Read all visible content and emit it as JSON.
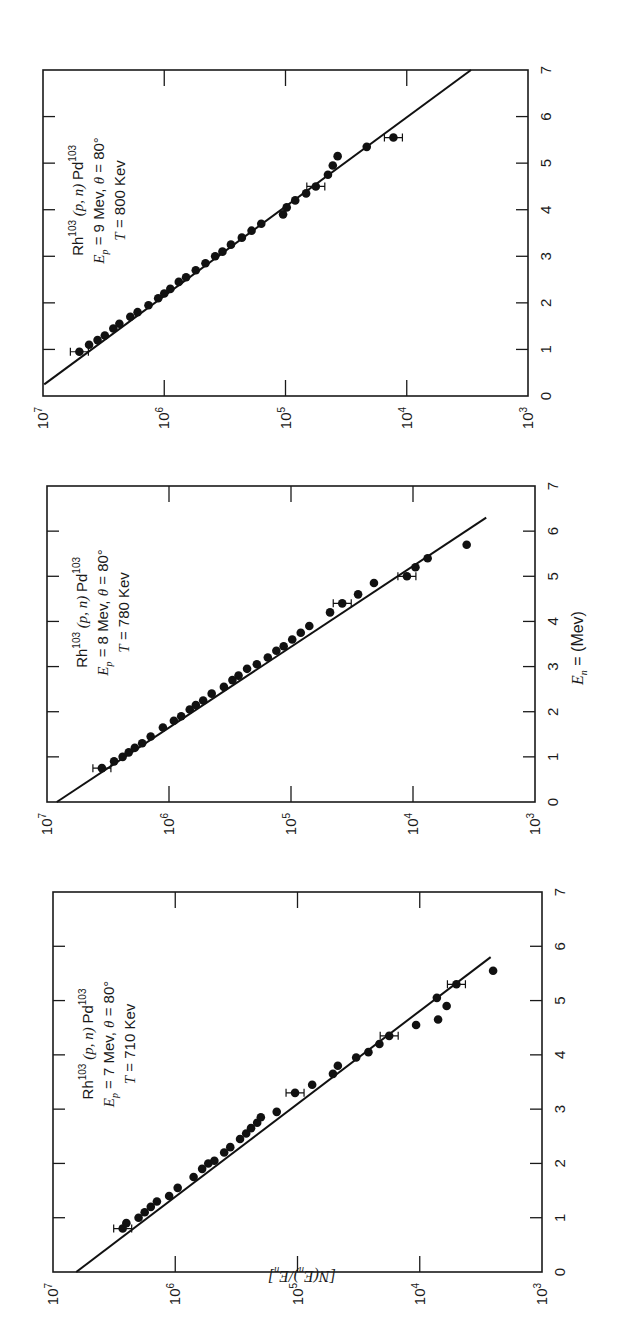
{
  "figure": {
    "orientation": "rotated 90 degrees counter-clockwise",
    "y_axis_label": "[N(E_n)/E_n]",
    "x_axis_label": "E_n = (Mev)",
    "x_axis_label_parts": {
      "var": "E",
      "sub": "n",
      "rest": " = (Mev)"
    },
    "y_axis_label_parts": {
      "text": "[N(E",
      "sub1": "n",
      "mid": ")/E",
      "sub2": "n",
      "end": "]"
    }
  },
  "chart_data": [
    {
      "type": "scatter",
      "panel": "top",
      "title": "Rh103 (p, n) Pd103, Ep = 9 Mev, θ = 80°, T = 800 Kev",
      "annotation": {
        "reaction": "Rh103 (p, n) Pd103",
        "line2": "E_p = 9 Mev, θ = 80°",
        "line3": "T = 800 Kev"
      },
      "xlabel": "E_n (Mev)",
      "ylabel": "[N(E_n)/E_n]",
      "xlim": [
        0,
        7
      ],
      "ylim": [
        1000,
        10000000
      ],
      "yscale": "log",
      "x_ticks": [
        "0",
        "1",
        "2",
        "3",
        "4",
        "5",
        "6",
        "7"
      ],
      "y_ticks": [
        "10^7",
        "10^6",
        "10^5",
        "10^4",
        "10^3"
      ],
      "fit_line": {
        "x": [
          0.25,
          7.0
        ],
        "log10_y": [
          6.99,
          3.47
        ]
      },
      "points": [
        {
          "x": 0.95,
          "log10_y": 6.7,
          "err": true
        },
        {
          "x": 1.1,
          "log10_y": 6.62
        },
        {
          "x": 1.2,
          "log10_y": 6.55
        },
        {
          "x": 1.3,
          "log10_y": 6.49
        },
        {
          "x": 1.45,
          "log10_y": 6.42
        },
        {
          "x": 1.55,
          "log10_y": 6.37
        },
        {
          "x": 1.7,
          "log10_y": 6.28
        },
        {
          "x": 1.8,
          "log10_y": 6.22
        },
        {
          "x": 1.95,
          "log10_y": 6.13
        },
        {
          "x": 2.1,
          "log10_y": 6.05
        },
        {
          "x": 2.2,
          "log10_y": 6.0
        },
        {
          "x": 2.3,
          "log10_y": 5.95
        },
        {
          "x": 2.45,
          "log10_y": 5.88
        },
        {
          "x": 2.55,
          "log10_y": 5.82
        },
        {
          "x": 2.7,
          "log10_y": 5.74
        },
        {
          "x": 2.85,
          "log10_y": 5.66
        },
        {
          "x": 3.0,
          "log10_y": 5.58
        },
        {
          "x": 3.1,
          "log10_y": 5.52
        },
        {
          "x": 3.25,
          "log10_y": 5.45
        },
        {
          "x": 3.4,
          "log10_y": 5.36
        },
        {
          "x": 3.55,
          "log10_y": 5.28
        },
        {
          "x": 3.7,
          "log10_y": 5.2
        },
        {
          "x": 3.9,
          "log10_y": 5.02
        },
        {
          "x": 4.05,
          "log10_y": 4.99
        },
        {
          "x": 4.2,
          "log10_y": 4.92
        },
        {
          "x": 4.35,
          "log10_y": 4.83
        },
        {
          "x": 4.5,
          "log10_y": 4.75,
          "err": true
        },
        {
          "x": 4.75,
          "log10_y": 4.65
        },
        {
          "x": 4.95,
          "log10_y": 4.61
        },
        {
          "x": 5.15,
          "log10_y": 4.57
        },
        {
          "x": 5.35,
          "log10_y": 4.33
        },
        {
          "x": 5.55,
          "log10_y": 4.11,
          "err": true
        }
      ]
    },
    {
      "type": "scatter",
      "panel": "middle",
      "title": "Rh103 (p, n) Pd103, Ep = 8 Mev, θ = 80°, T = 780 Kev",
      "annotation": {
        "reaction": "Rh103 (p, n) Pd103",
        "line2": "E_p = 8 Mev, θ = 80°",
        "line3": "T = 780 Kev"
      },
      "xlabel": "E_n = (Mev)",
      "ylabel": "[N(E_n)/E_n]",
      "xlim": [
        0,
        7
      ],
      "ylim": [
        1000,
        10000000
      ],
      "yscale": "log",
      "x_ticks": [
        "0",
        "1",
        "2",
        "3",
        "4",
        "5",
        "6",
        "7"
      ],
      "y_ticks": [
        "10^7",
        "10^6",
        "10^5",
        "10^4",
        "10^3"
      ],
      "fit_line": {
        "x": [
          0.0,
          6.3
        ],
        "log10_y": [
          6.92,
          3.4
        ]
      },
      "points": [
        {
          "x": 0.75,
          "log10_y": 6.55,
          "err": true
        },
        {
          "x": 0.9,
          "log10_y": 6.45
        },
        {
          "x": 1.0,
          "log10_y": 6.38
        },
        {
          "x": 1.1,
          "log10_y": 6.33
        },
        {
          "x": 1.2,
          "log10_y": 6.28
        },
        {
          "x": 1.3,
          "log10_y": 6.22
        },
        {
          "x": 1.45,
          "log10_y": 6.15
        },
        {
          "x": 1.65,
          "log10_y": 6.05
        },
        {
          "x": 1.8,
          "log10_y": 5.96
        },
        {
          "x": 1.9,
          "log10_y": 5.9
        },
        {
          "x": 2.05,
          "log10_y": 5.83
        },
        {
          "x": 2.15,
          "log10_y": 5.78
        },
        {
          "x": 2.25,
          "log10_y": 5.72
        },
        {
          "x": 2.4,
          "log10_y": 5.65
        },
        {
          "x": 2.55,
          "log10_y": 5.55
        },
        {
          "x": 2.7,
          "log10_y": 5.48
        },
        {
          "x": 2.8,
          "log10_y": 5.43
        },
        {
          "x": 2.95,
          "log10_y": 5.36
        },
        {
          "x": 3.05,
          "log10_y": 5.28
        },
        {
          "x": 3.2,
          "log10_y": 5.19
        },
        {
          "x": 3.35,
          "log10_y": 5.12
        },
        {
          "x": 3.45,
          "log10_y": 5.06
        },
        {
          "x": 3.6,
          "log10_y": 4.99
        },
        {
          "x": 3.75,
          "log10_y": 4.92
        },
        {
          "x": 3.9,
          "log10_y": 4.85
        },
        {
          "x": 4.2,
          "log10_y": 4.68
        },
        {
          "x": 4.4,
          "log10_y": 4.58,
          "err": true
        },
        {
          "x": 4.6,
          "log10_y": 4.45
        },
        {
          "x": 4.85,
          "log10_y": 4.32
        },
        {
          "x": 5.0,
          "log10_y": 4.05,
          "err": true
        },
        {
          "x": 5.2,
          "log10_y": 3.98
        },
        {
          "x": 5.4,
          "log10_y": 3.88
        },
        {
          "x": 5.7,
          "log10_y": 3.56
        }
      ]
    },
    {
      "type": "scatter",
      "panel": "bottom",
      "title": "Rh103 (p, n) Pd103, Ep = 7 Mev, θ = 80°, T = 710 Kev",
      "annotation": {
        "reaction": "Rh103 (p, n) Pd103",
        "line2": "E_p = 7 Mev, θ = 80°",
        "line3": "T = 710 Kev"
      },
      "xlabel": "E_n (Mev)",
      "ylabel": "[N(E_n)/E_n]",
      "xlim": [
        0,
        7
      ],
      "ylim": [
        1000,
        10000000
      ],
      "yscale": "log",
      "x_ticks": [
        "0",
        "1",
        "2",
        "3",
        "4",
        "5",
        "6",
        "7"
      ],
      "y_ticks": [
        "10^7",
        "10^6",
        "10^5",
        "10^4",
        "10^3"
      ],
      "fit_line": {
        "x": [
          0.0,
          5.8
        ],
        "log10_y": [
          6.81,
          3.42
        ]
      },
      "points": [
        {
          "x": 0.8,
          "log10_y": 6.43,
          "err": true
        },
        {
          "x": 0.9,
          "log10_y": 6.4
        },
        {
          "x": 1.0,
          "log10_y": 6.3
        },
        {
          "x": 1.1,
          "log10_y": 6.25
        },
        {
          "x": 1.2,
          "log10_y": 6.2
        },
        {
          "x": 1.3,
          "log10_y": 6.15
        },
        {
          "x": 1.4,
          "log10_y": 6.05
        },
        {
          "x": 1.55,
          "log10_y": 5.98
        },
        {
          "x": 1.75,
          "log10_y": 5.85
        },
        {
          "x": 1.9,
          "log10_y": 5.78
        },
        {
          "x": 2.0,
          "log10_y": 5.73
        },
        {
          "x": 2.05,
          "log10_y": 5.68
        },
        {
          "x": 2.2,
          "log10_y": 5.6
        },
        {
          "x": 2.3,
          "log10_y": 5.55
        },
        {
          "x": 2.45,
          "log10_y": 5.47
        },
        {
          "x": 2.55,
          "log10_y": 5.42
        },
        {
          "x": 2.65,
          "log10_y": 5.38
        },
        {
          "x": 2.75,
          "log10_y": 5.33
        },
        {
          "x": 2.85,
          "log10_y": 5.3
        },
        {
          "x": 2.95,
          "log10_y": 5.17
        },
        {
          "x": 3.3,
          "log10_y": 5.02,
          "err": true
        },
        {
          "x": 3.45,
          "log10_y": 4.88
        },
        {
          "x": 3.65,
          "log10_y": 4.71
        },
        {
          "x": 3.8,
          "log10_y": 4.67
        },
        {
          "x": 3.95,
          "log10_y": 4.52
        },
        {
          "x": 4.05,
          "log10_y": 4.42
        },
        {
          "x": 4.2,
          "log10_y": 4.33
        },
        {
          "x": 4.35,
          "log10_y": 4.25,
          "err": true
        },
        {
          "x": 4.55,
          "log10_y": 4.03
        },
        {
          "x": 4.65,
          "log10_y": 3.85
        },
        {
          "x": 4.9,
          "log10_y": 3.78
        },
        {
          "x": 5.05,
          "log10_y": 3.86
        },
        {
          "x": 5.3,
          "log10_y": 3.7,
          "err": true
        },
        {
          "x": 5.55,
          "log10_y": 3.4
        }
      ]
    }
  ]
}
